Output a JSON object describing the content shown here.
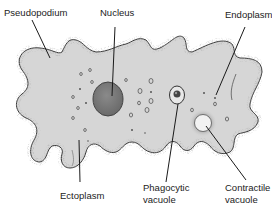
{
  "diagram": {
    "colors": {
      "cytoplasm": "#d6d6d6",
      "ectoplasm_stipple": "#7a7a7a",
      "outline": "#3a3a3a",
      "nucleus": "#7d7d7d",
      "contractile_vacuole": "#f2f2f2",
      "leader_line": "#1a1a1a",
      "label_text": "#222222"
    },
    "labels": {
      "pseudopodium": "Pseudopodium",
      "nucleus": "Nucleus",
      "endoplasm": "Endoplasm",
      "ectoplasm": "Ectoplasm",
      "phagocytic_line1": "Phagocytic",
      "phagocytic_line2": "vacuole",
      "contractile_line1": "Contractile",
      "contractile_line2": "vacuole"
    }
  }
}
